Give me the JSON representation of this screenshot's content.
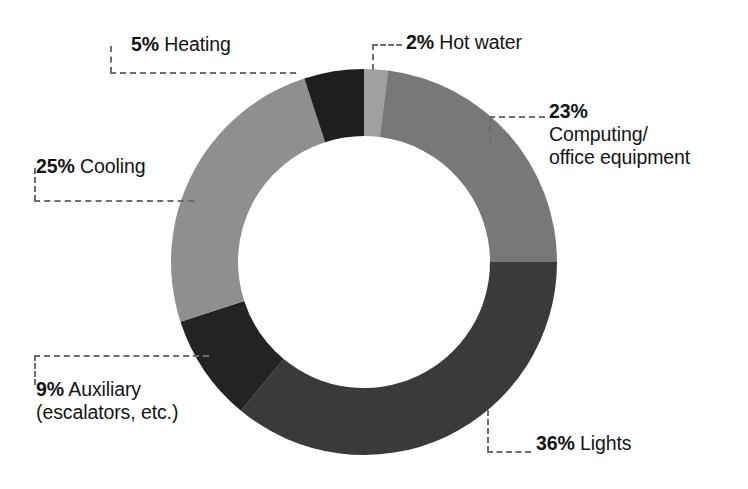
{
  "chart_data": {
    "type": "pie",
    "variant": "donut",
    "title": "",
    "subtitle": "",
    "xlabel": "",
    "ylabel": "",
    "legend_position": "callout-labels",
    "grid": false,
    "units": "percent",
    "total": 100,
    "start_angle_deg": 0,
    "direction": "clockwise",
    "categories": [
      "Hot water",
      "Computing/office equipment",
      "Lights",
      "Auxiliary (escalators, etc.)",
      "Cooling",
      "Heating"
    ],
    "values": [
      2,
      23,
      36,
      9,
      25,
      5
    ],
    "colors": [
      "#a0a0a0",
      "#787878",
      "#3a3a3a",
      "#232323",
      "#8f8f8f",
      "#1e1e1e"
    ],
    "slices": [
      {
        "id": "hot-water",
        "percent_label": "2%",
        "value": 2,
        "name": "Hot water",
        "name_line1": "Hot water",
        "name_line2": "",
        "color": "#a0a0a0"
      },
      {
        "id": "computing",
        "percent_label": "23%",
        "value": 23,
        "name": "Computing/office equipment",
        "name_line1": "Computing/",
        "name_line2": "office equipment",
        "color": "#787878"
      },
      {
        "id": "lights",
        "percent_label": "36%",
        "value": 36,
        "name": "Lights",
        "name_line1": "Lights",
        "name_line2": "",
        "color": "#3a3a3a"
      },
      {
        "id": "auxiliary",
        "percent_label": "9%",
        "value": 9,
        "name": "Auxiliary (escalators, etc.)",
        "name_line1": "Auxiliary",
        "name_line2": "(escalators, etc.)",
        "color": "#232323"
      },
      {
        "id": "cooling",
        "percent_label": "25%",
        "value": 25,
        "name": "Cooling",
        "name_line1": "Cooling",
        "name_line2": "",
        "color": "#8f8f8f"
      },
      {
        "id": "heating",
        "percent_label": "5%",
        "value": 5,
        "name": "Heating",
        "name_line1": "Heating",
        "name_line2": "",
        "color": "#1e1e1e"
      }
    ]
  },
  "geometry": {
    "center_x": 364,
    "center_y": 262,
    "outer_radius": 193,
    "inner_radius": 126
  },
  "style": {
    "background": "#ffffff",
    "text_color": "#141414",
    "leader_color": "#6d6d6d"
  }
}
